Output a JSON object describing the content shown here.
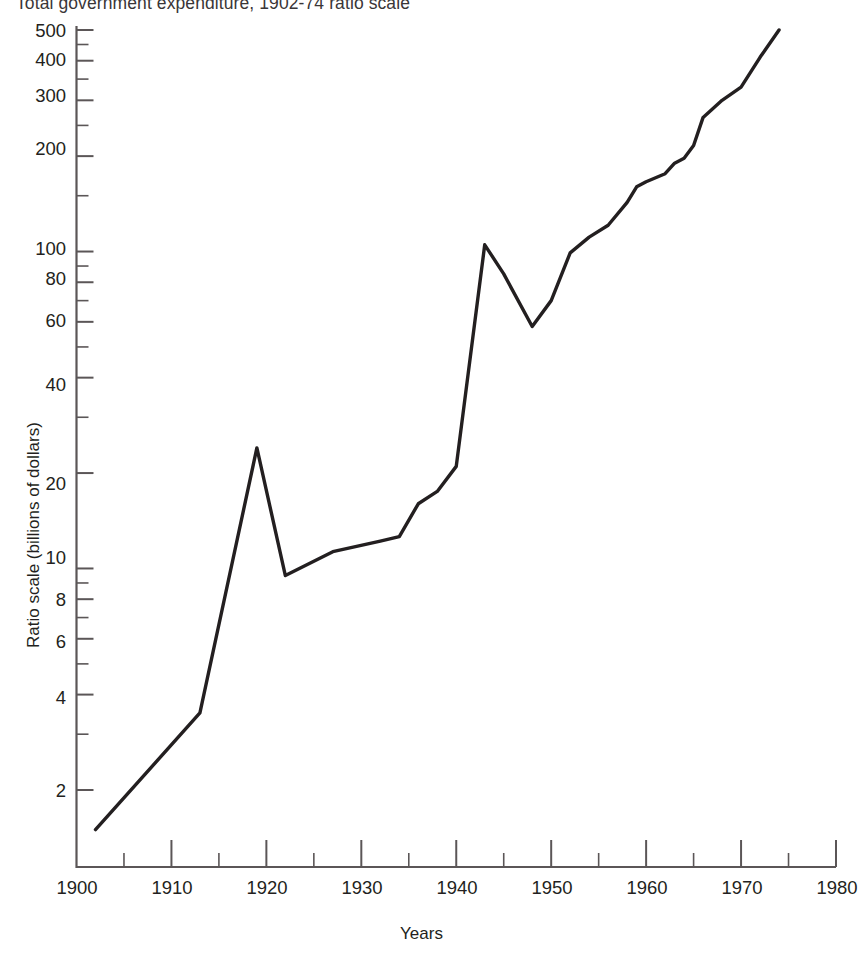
{
  "chart_data": {
    "type": "line",
    "title": "Total government expenditure, 1902-74 ratio scale",
    "xlabel": "Years",
    "ylabel": "Ratio scale (billions of dollars)",
    "yscale": "log",
    "xlim": [
      1900,
      1980
    ],
    "ylim": [
      1.3,
      560
    ],
    "grid": false,
    "legend": null,
    "y_ticks_labeled": [
      2,
      4,
      6,
      8,
      10,
      20,
      40,
      60,
      80,
      100,
      200,
      300,
      400,
      500
    ],
    "y_ticks_minor": [
      3,
      5,
      7,
      9,
      30,
      50,
      70,
      90,
      150,
      250,
      350,
      450
    ],
    "x_ticks_labeled": [
      1900,
      1910,
      1920,
      1930,
      1940,
      1950,
      1960,
      1970,
      1980
    ],
    "x_ticks_minor": [
      1905,
      1915,
      1925,
      1935,
      1945,
      1955,
      1965,
      1975
    ],
    "series": [
      {
        "name": "Total government expenditure",
        "color": "#231f20",
        "x": [
          1902,
          1913,
          1919,
          1922,
          1927,
          1932,
          1934,
          1936,
          1938,
          1940,
          1943,
          1945,
          1948,
          1950,
          1952,
          1954,
          1956,
          1958,
          1959,
          1960,
          1962,
          1963,
          1964,
          1965,
          1966,
          1968,
          1970,
          1972,
          1974
        ],
        "y": [
          1.5,
          3.5,
          24.0,
          9.5,
          11.3,
          12.2,
          12.6,
          16.0,
          17.5,
          21.0,
          105.0,
          85.0,
          58.0,
          70.0,
          99.0,
          111.0,
          121.0,
          143.0,
          160.0,
          166.0,
          176.0,
          190.0,
          197.0,
          216.0,
          265.0,
          300.0,
          330.0,
          410.0,
          500.0
        ]
      }
    ]
  },
  "labels": {
    "y_500": "500",
    "y_400": "400",
    "y_300": "300",
    "y_200": "200",
    "y_100": "100",
    "y_80": "80",
    "y_60": "60",
    "y_40": "40",
    "y_20": "20",
    "y_10": "10",
    "y_8": "8",
    "y_6": "6",
    "y_4": "4",
    "y_2": "2",
    "x_1900": "1900",
    "x_1910": "1910",
    "x_1920": "1920",
    "x_1930": "1930",
    "x_1940": "1940",
    "x_1950": "1950",
    "x_1960": "1960",
    "x_1970": "1970",
    "x_1980": "1980"
  }
}
